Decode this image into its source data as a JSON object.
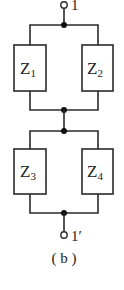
{
  "diagram": {
    "type": "circuit",
    "terminals": [
      {
        "id": "t1",
        "label": "1"
      },
      {
        "id": "t1p",
        "label": "1′"
      }
    ],
    "impedances": [
      {
        "id": "z1",
        "name": "Z",
        "sub": "1"
      },
      {
        "id": "z2",
        "name": "Z",
        "sub": "2"
      },
      {
        "id": "z3",
        "name": "Z",
        "sub": "3"
      },
      {
        "id": "z4",
        "name": "Z",
        "sub": "4"
      }
    ],
    "caption": "( b )",
    "colors": {
      "line": "#2a2a2a",
      "node": "#111111",
      "background": "#ffffff"
    }
  }
}
